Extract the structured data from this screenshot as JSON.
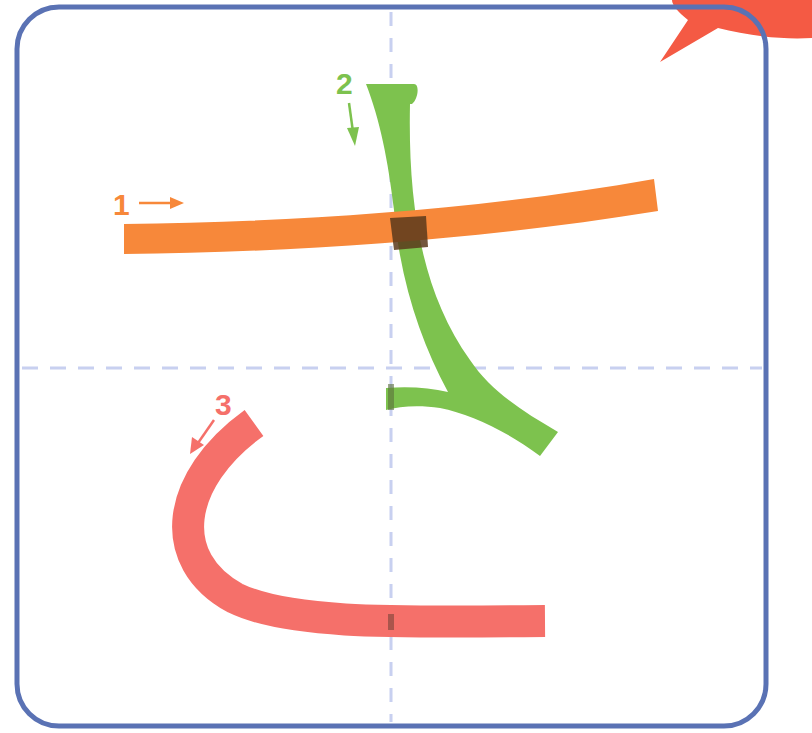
{
  "diagram": {
    "character": "さ",
    "stroke_count": 3,
    "colors": {
      "frame": "#5a72b4",
      "guide": "#c8d0f0",
      "stroke_1": "#f7883a",
      "stroke_2": "#7dc24e",
      "stroke_3": "#f5706a",
      "overlap": "#5b3a1c",
      "badge": "#f45a44"
    },
    "strokes": [
      {
        "number": "1",
        "direction": "right",
        "color_key": "stroke_1"
      },
      {
        "number": "2",
        "direction": "down",
        "color_key": "stroke_2"
      },
      {
        "number": "3",
        "direction": "down-left",
        "color_key": "stroke_3"
      }
    ]
  }
}
